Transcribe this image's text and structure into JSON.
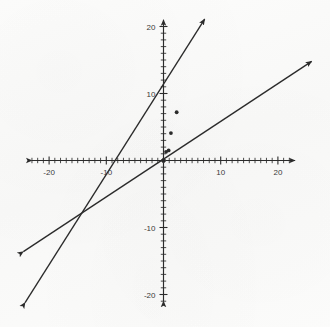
{
  "figure": {
    "caption_remnant": "",
    "background_color": "#fbfbfa",
    "ink_color": "#2b2b2b"
  },
  "axes": {
    "x_axis_name": "x-axis",
    "y_axis_name": "y-axis",
    "x_labels": [
      "-20",
      "-10",
      "10",
      "20"
    ],
    "y_labels": [
      "20",
      "10",
      "-10",
      "-20"
    ]
  },
  "chart_data": {
    "type": "line",
    "title": "",
    "subtitle": "",
    "xlabel": "",
    "ylabel": "",
    "xlim": [
      -23,
      23
    ],
    "ylim": [
      -21,
      21
    ],
    "grid": false,
    "legend": false,
    "axis_arrows": true,
    "tick_interval": 1,
    "labeled_ticks": {
      "x": [
        -20,
        -10,
        10,
        20
      ],
      "y": [
        -20,
        -10,
        10,
        20
      ]
    },
    "series": [
      {
        "name": "steep line",
        "slope": 3,
        "intercept": 0,
        "x": [
          -24.2,
          7.2
        ],
        "y": [
          -21.2,
          21.1
        ],
        "arrow_start": true,
        "arrow_end": true,
        "points": [
          {
            "x": 0,
            "y": 0
          },
          {
            "x": 0.45,
            "y": 1.3
          },
          {
            "x": 1.3,
            "y": 4.1
          },
          {
            "x": 2.3,
            "y": 7.2
          }
        ]
      },
      {
        "name": "shallow line",
        "slope": 0.6,
        "intercept": 0,
        "x": [
          -24.5,
          25.9
        ],
        "y": [
          -13.6,
          14.8
        ],
        "arrow_start": true,
        "arrow_end": true,
        "points": [
          {
            "x": 0.9,
            "y": 1.5
          }
        ]
      }
    ]
  }
}
